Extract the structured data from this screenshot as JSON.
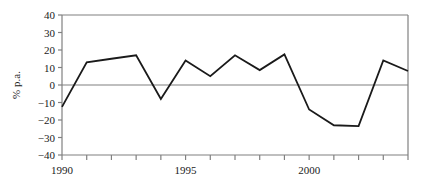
{
  "chart_data": {
    "type": "line",
    "title": "",
    "xlabel": "",
    "ylabel": "% p.a.",
    "x": [
      1990,
      1991,
      1992,
      1993,
      1994,
      1995,
      1996,
      1997,
      1998,
      1999,
      2000,
      2001,
      2002,
      2003,
      2004
    ],
    "values": [
      -12.5,
      13.0,
      15.0,
      17.0,
      -8.0,
      14.0,
      5.0,
      17.0,
      8.5,
      17.5,
      -14.0,
      -23.0,
      -23.5,
      14.0,
      8.0
    ],
    "series": [
      {
        "name": "% p.a.",
        "values": [
          -12.5,
          13.0,
          15.0,
          17.0,
          -8.0,
          14.0,
          5.0,
          17.0,
          8.5,
          17.5,
          -14.0,
          -23.0,
          -23.5,
          14.0,
          8.0
        ]
      }
    ],
    "xlim": [
      1990,
      2004
    ],
    "ylim": [
      -40,
      40
    ],
    "ytick_values": [
      40,
      30,
      20,
      10,
      0,
      -10,
      -20,
      -30,
      -40
    ],
    "ytick_labels": [
      "40",
      "30",
      "20",
      "10",
      "0",
      "−10",
      "−20",
      "−30",
      "−40"
    ],
    "xtick_values": [
      1990,
      1991,
      1992,
      1993,
      1994,
      1995,
      1996,
      1997,
      1998,
      1999,
      2000,
      2001,
      2002,
      2003,
      2004
    ],
    "xtick_labeled": [
      1990,
      1995,
      2000
    ],
    "xtick_labels": [
      "1990",
      "1995",
      "2000"
    ],
    "grid": false,
    "zero_line": true,
    "legend": null,
    "legend_position": "none",
    "colors": {
      "series_line": "#1a1a1a",
      "axis": "#808080",
      "zero_line": "#808080",
      "text": "#1a1a1a",
      "background": "#ffffff"
    }
  }
}
